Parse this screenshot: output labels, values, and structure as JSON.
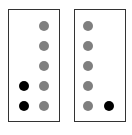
{
  "colors": {
    "gray": "#7f7f7f",
    "black": "#000000",
    "border": "#333333"
  },
  "panels": [
    {
      "name": "left-panel",
      "box": {
        "x": 8,
        "y": 9,
        "w": 52,
        "h": 113
      },
      "dots": [
        {
          "x": 44,
          "y": 26,
          "color": "gray"
        },
        {
          "x": 44,
          "y": 46,
          "color": "gray"
        },
        {
          "x": 44,
          "y": 66,
          "color": "gray"
        },
        {
          "x": 44,
          "y": 86,
          "color": "gray"
        },
        {
          "x": 44,
          "y": 106,
          "color": "gray"
        },
        {
          "x": 24,
          "y": 86,
          "color": "black"
        },
        {
          "x": 24,
          "y": 106,
          "color": "black"
        }
      ]
    },
    {
      "name": "right-panel",
      "box": {
        "x": 74,
        "y": 9,
        "w": 52,
        "h": 113
      },
      "dots": [
        {
          "x": 88,
          "y": 26,
          "color": "gray"
        },
        {
          "x": 88,
          "y": 46,
          "color": "gray"
        },
        {
          "x": 88,
          "y": 66,
          "color": "gray"
        },
        {
          "x": 88,
          "y": 86,
          "color": "gray"
        },
        {
          "x": 88,
          "y": 106,
          "color": "gray"
        },
        {
          "x": 109,
          "y": 106,
          "color": "black"
        }
      ]
    }
  ]
}
